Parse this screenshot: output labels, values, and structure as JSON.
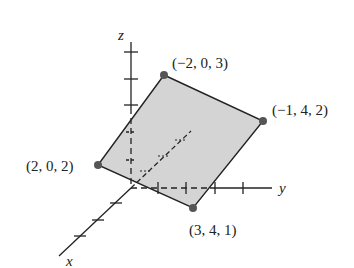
{
  "figure": {
    "type": "3d-plane-diagram",
    "axes": {
      "x_label": "x",
      "y_label": "y",
      "z_label": "z"
    },
    "vertices": [
      {
        "label": "(−2, 0, 3)",
        "coords": [
          -2,
          0,
          3
        ]
      },
      {
        "label": "(−1, 4, 2)",
        "coords": [
          -1,
          4,
          2
        ]
      },
      {
        "label": "(3, 4, 1)",
        "coords": [
          3,
          4,
          1
        ]
      },
      {
        "label": "(2, 0, 2)",
        "coords": [
          2,
          0,
          2
        ]
      }
    ],
    "colors": {
      "plane_fill": "#d4d4d4",
      "edge": "#222222",
      "point": "#555555"
    }
  }
}
